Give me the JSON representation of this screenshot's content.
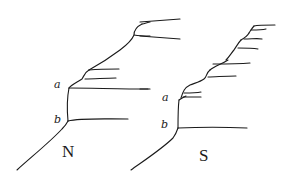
{
  "figure": {
    "panels": [
      {
        "id": "north",
        "title": "N",
        "points": [
          {
            "label": "a"
          },
          {
            "label": "b"
          }
        ]
      },
      {
        "id": "south",
        "title": "S",
        "points": [
          {
            "label": "a"
          },
          {
            "label": "b"
          }
        ]
      }
    ],
    "ink_color": "#1a1a1a",
    "background": "#ffffff"
  }
}
